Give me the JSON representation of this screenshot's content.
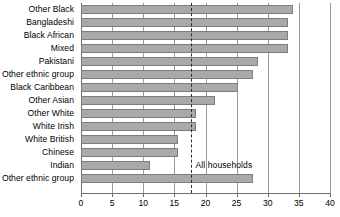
{
  "chart_data": {
    "type": "bar",
    "orientation": "horizontal",
    "title": "",
    "subtitle": "",
    "xlabel": "",
    "ylabel": "",
    "xlim": [
      0,
      40
    ],
    "xticks": [
      0,
      5,
      10,
      15,
      20,
      25,
      30,
      35,
      40
    ],
    "xtick_labels": [
      "0",
      "5",
      "10",
      "15",
      "20",
      "25",
      "30",
      "35",
      "40"
    ],
    "grid": true,
    "grid_axis": "x",
    "legend": false,
    "bar_color": "#a9a9a9",
    "bar_edge_color": "#7d7d7d",
    "categories": [
      "Other Black",
      "Bangladeshi",
      "Black African",
      "Mixed",
      "Pakistani",
      "Other ethnic group",
      "Black Caribbean",
      "Other  Asian",
      "Other White",
      "White Irish",
      "White British",
      "Chinese",
      "Indian",
      "Other ethnic group"
    ],
    "values": [
      34.0,
      33.3,
      33.3,
      33.3,
      28.5,
      27.7,
      25.3,
      21.6,
      18.4,
      18.4,
      15.6,
      15.6,
      11.1,
      27.7
    ],
    "annotations": [
      {
        "name": "all-households-reference",
        "label": "All households",
        "value": 17.6,
        "style": "dashed-vertical",
        "color": "#2b2b2b"
      }
    ]
  }
}
